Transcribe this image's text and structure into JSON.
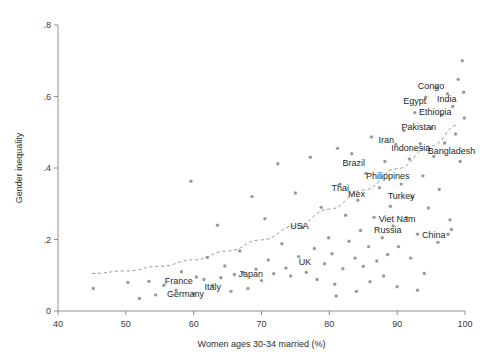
{
  "chart_data": {
    "type": "scatter",
    "title": "",
    "xlabel": "Women ages 30-34 married (%)",
    "ylabel": "Gender inequality",
    "xlim": [
      40,
      100
    ],
    "ylim": [
      0,
      0.8
    ],
    "xticks": [
      40,
      50,
      60,
      70,
      80,
      90,
      100
    ],
    "xtick_labels": [
      "40",
      "50",
      "60",
      "70",
      "80",
      "90",
      "100"
    ],
    "yticks": [
      0,
      0.2,
      0.4,
      0.6,
      0.8
    ],
    "ytick_labels": [
      "0",
      ".2",
      ".4",
      ".6",
      ".8"
    ],
    "grid": false,
    "legend": "none",
    "marker_color": "#9a9a9a",
    "fitline_color": "#9a9a9a",
    "fitline_style": "dashed",
    "fitline_description": "Upward-curving dashed quadratic fit rising from about 0.10 at x=45 to about 0.52 at x=99",
    "fitline_points": [
      [
        45,
        0.105
      ],
      [
        50,
        0.112
      ],
      [
        55,
        0.125
      ],
      [
        60,
        0.143
      ],
      [
        65,
        0.168
      ],
      [
        70,
        0.199
      ],
      [
        75,
        0.238
      ],
      [
        80,
        0.285
      ],
      [
        85,
        0.338
      ],
      [
        90,
        0.398
      ],
      [
        95,
        0.462
      ],
      [
        99,
        0.52
      ]
    ],
    "points": [
      [
        45.2,
        0.063
      ],
      [
        50.3,
        0.08
      ],
      [
        52.0,
        0.035
      ],
      [
        53.4,
        0.083
      ],
      [
        54.4,
        0.045
      ],
      [
        55.6,
        0.072
      ],
      [
        57.4,
        0.058
      ],
      [
        58.2,
        0.11
      ],
      [
        59.6,
        0.363
      ],
      [
        60.0,
        0.048
      ],
      [
        60.4,
        0.095
      ],
      [
        61.5,
        0.088
      ],
      [
        62.0,
        0.15
      ],
      [
        62.8,
        0.072
      ],
      [
        63.5,
        0.24
      ],
      [
        64.0,
        0.093
      ],
      [
        64.6,
        0.126
      ],
      [
        65.5,
        0.055
      ],
      [
        66.0,
        0.102
      ],
      [
        66.8,
        0.168
      ],
      [
        67.3,
        0.108
      ],
      [
        68.0,
        0.063
      ],
      [
        68.6,
        0.32
      ],
      [
        69.2,
        0.117
      ],
      [
        70.0,
        0.085
      ],
      [
        70.5,
        0.258
      ],
      [
        71.0,
        0.143
      ],
      [
        71.8,
        0.104
      ],
      [
        72.4,
        0.412
      ],
      [
        73.0,
        0.188
      ],
      [
        73.6,
        0.12
      ],
      [
        74.3,
        0.098
      ],
      [
        75.0,
        0.33
      ],
      [
        75.5,
        0.152
      ],
      [
        76.0,
        0.235
      ],
      [
        76.6,
        0.108
      ],
      [
        77.2,
        0.43
      ],
      [
        77.8,
        0.175
      ],
      [
        78.2,
        0.088
      ],
      [
        78.8,
        0.29
      ],
      [
        79.3,
        0.132
      ],
      [
        79.9,
        0.205
      ],
      [
        80.4,
        0.16
      ],
      [
        80.8,
        0.075
      ],
      [
        81.2,
        0.455
      ],
      [
        81.6,
        0.355
      ],
      [
        82.0,
        0.118
      ],
      [
        82.4,
        0.268
      ],
      [
        82.9,
        0.195
      ],
      [
        83.3,
        0.44
      ],
      [
        83.8,
        0.148
      ],
      [
        84.2,
        0.31
      ],
      [
        84.6,
        0.225
      ],
      [
        85.0,
        0.125
      ],
      [
        85.4,
        0.385
      ],
      [
        85.8,
        0.18
      ],
      [
        86.2,
        0.487
      ],
      [
        86.6,
        0.262
      ],
      [
        87.0,
        0.14
      ],
      [
        87.4,
        0.345
      ],
      [
        87.8,
        0.205
      ],
      [
        88.2,
        0.418
      ],
      [
        88.6,
        0.158
      ],
      [
        89.0,
        0.293
      ],
      [
        89.4,
        0.238
      ],
      [
        89.8,
        0.466
      ],
      [
        90.2,
        0.18
      ],
      [
        90.6,
        0.355
      ],
      [
        91.0,
        0.505
      ],
      [
        91.4,
        0.262
      ],
      [
        91.8,
        0.425
      ],
      [
        92.2,
        0.318
      ],
      [
        92.6,
        0.555
      ],
      [
        93.0,
        0.215
      ],
      [
        93.4,
        0.468
      ],
      [
        93.8,
        0.378
      ],
      [
        94.2,
        0.598
      ],
      [
        94.6,
        0.288
      ],
      [
        95.0,
        0.512
      ],
      [
        95.4,
        0.432
      ],
      [
        95.8,
        0.625
      ],
      [
        96.2,
        0.34
      ],
      [
        96.6,
        0.548
      ],
      [
        97.0,
        0.47
      ],
      [
        97.4,
        0.608
      ],
      [
        97.8,
        0.255
      ],
      [
        98.2,
        0.572
      ],
      [
        98.6,
        0.495
      ],
      [
        99.0,
        0.648
      ],
      [
        99.3,
        0.418
      ],
      [
        99.6,
        0.7
      ],
      [
        99.8,
        0.612
      ],
      [
        99.9,
        0.54
      ],
      [
        86.0,
        0.082
      ],
      [
        88.0,
        0.098
      ],
      [
        90.0,
        0.068
      ],
      [
        92.0,
        0.148
      ],
      [
        94.0,
        0.105
      ],
      [
        96.0,
        0.192
      ],
      [
        98.0,
        0.228
      ],
      [
        84.0,
        0.055
      ],
      [
        81.0,
        0.042
      ],
      [
        97.5,
        0.215
      ],
      [
        93.0,
        0.058
      ]
    ],
    "labels": [
      {
        "text": "Congo",
        "x": 95.0,
        "y": 0.62
      },
      {
        "text": "India",
        "x": 97.3,
        "y": 0.585
      },
      {
        "text": "Egypt",
        "x": 92.6,
        "y": 0.578
      },
      {
        "text": "Ethiopia",
        "x": 95.6,
        "y": 0.548
      },
      {
        "text": "Pakistan",
        "x": 93.2,
        "y": 0.505
      },
      {
        "text": "Iran",
        "x": 88.4,
        "y": 0.47
      },
      {
        "text": "Indonesia",
        "x": 92.0,
        "y": 0.448
      },
      {
        "text": "Bangladesh",
        "x": 98.0,
        "y": 0.44
      },
      {
        "text": "Brazil",
        "x": 83.6,
        "y": 0.405
      },
      {
        "text": "Philippines",
        "x": 88.6,
        "y": 0.368
      },
      {
        "text": "Thai",
        "x": 81.6,
        "y": 0.335
      },
      {
        "text": "Mex",
        "x": 84.0,
        "y": 0.32
      },
      {
        "text": "Turkey",
        "x": 90.6,
        "y": 0.312
      },
      {
        "text": "Viet Nam",
        "x": 90.0,
        "y": 0.248
      },
      {
        "text": "Russia",
        "x": 88.6,
        "y": 0.218
      },
      {
        "text": "USA",
        "x": 75.6,
        "y": 0.228
      },
      {
        "text": "China",
        "x": 95.4,
        "y": 0.205
      },
      {
        "text": "UK",
        "x": 76.4,
        "y": 0.128
      },
      {
        "text": "Japan",
        "x": 68.4,
        "y": 0.095
      },
      {
        "text": "France",
        "x": 57.8,
        "y": 0.075
      },
      {
        "text": "Italy",
        "x": 62.8,
        "y": 0.06
      },
      {
        "text": "Germany",
        "x": 58.8,
        "y": 0.04
      }
    ]
  }
}
